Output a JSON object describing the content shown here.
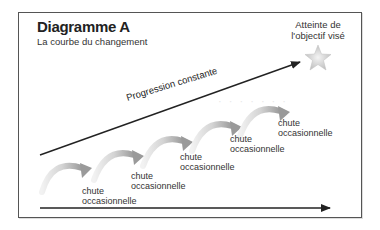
{
  "diagram": {
    "title": "Diagramme A",
    "subtitle": "La courbe du changement",
    "goal_label_line1": "Atteinte de",
    "goal_label_line2": "l'objectif visé",
    "progress_label": "Progression constante",
    "drop_labels": [
      {
        "line1": "chute",
        "line2": "occasionnelle"
      },
      {
        "line1": "chute",
        "line2": "occasionnelle"
      },
      {
        "line1": "chute",
        "line2": "occasionnelle"
      },
      {
        "line1": "chute",
        "line2": "occasionnelle"
      },
      {
        "line1": "chute",
        "line2": "occasionnelle"
      }
    ],
    "colors": {
      "arrow": "#222222",
      "arc_light": "#f0f0f0",
      "arc_dark": "#9a9a9a",
      "star": "#c8c8c8"
    }
  }
}
